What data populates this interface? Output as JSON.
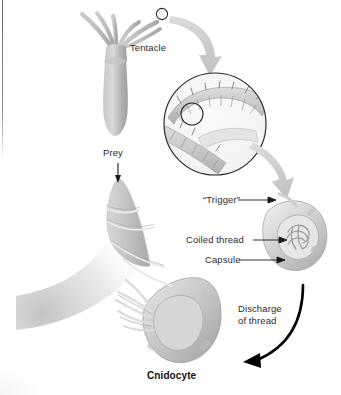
{
  "figure": {
    "background_color": "#ffffff"
  },
  "labels": {
    "tentacle": "Tentacle",
    "prey": "Prey",
    "trigger": "“Trigger”",
    "coiled_thread": "Coiled thread",
    "capsule": "Capsule",
    "discharge_line1": "Discharge",
    "discharge_line2": "of thread",
    "cnidocyte": "Cnidocyte"
  },
  "colors": {
    "organism_fill": "#b9b9b9",
    "organism_light": "#d6d6d6",
    "organism_dark": "#8f8f8f",
    "zoom_arrow": "#d2d2d2",
    "discharge_arrow": "#000000",
    "leader_line": "#1a1a1a",
    "text": "#2b2b2b",
    "outline": "#2b2b2b"
  },
  "parts": [
    {
      "name": "hydra-polyp",
      "description": "Hydra body with radiating tentacles"
    },
    {
      "name": "tentacle-tip-marker",
      "description": "Small circle marking magnified tentacle tip"
    },
    {
      "name": "magnified-tentacle-circle",
      "description": "Circular inset of tentacle surface with cnidocyte cells"
    },
    {
      "name": "cnidocyte-undischarged",
      "description": "Cnidocyte before firing, showing trigger, coiled thread and capsule"
    },
    {
      "name": "cnidocyte-discharged",
      "description": "Cnidocyte after firing with everted thread"
    },
    {
      "name": "prey-body",
      "description": "Prey pierced and wrapped by discharged thread"
    }
  ],
  "arrows": [
    {
      "name": "zoom-arrow-tentacle-to-inset",
      "style": "thick gray curve"
    },
    {
      "name": "zoom-arrow-inset-to-cnidocyte",
      "style": "thick gray curve"
    },
    {
      "name": "discharge-arrow",
      "style": "black curved arrow"
    },
    {
      "name": "prey-arrow",
      "style": "thin black arrow pointing down"
    },
    {
      "name": "leader-trigger",
      "style": "thin line with arrowhead"
    },
    {
      "name": "leader-coiled-thread",
      "style": "thin line with arrowhead"
    },
    {
      "name": "leader-capsule",
      "style": "thin line with arrowhead"
    }
  ]
}
